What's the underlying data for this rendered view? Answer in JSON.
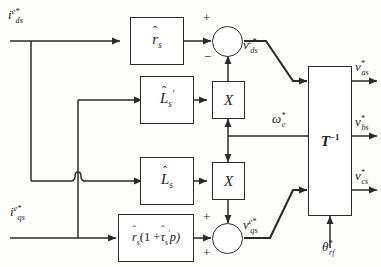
{
  "figure": {
    "type": "control-block-diagram",
    "style": "scanned grayscale line drawing"
  },
  "inputs": [
    {
      "id": "ids",
      "label_base": "i",
      "label_sup": "e*",
      "label_sub": "ds",
      "text": "i^(e*)_ds"
    },
    {
      "id": "iqs",
      "label_base": "i",
      "label_sup": "e*",
      "label_sub": "qs",
      "text": "i^(e*)_qs"
    },
    {
      "id": "we",
      "label_base": "ω",
      "label_sup": "*",
      "label_sub": "e",
      "text": "ω*_e"
    },
    {
      "id": "thrf",
      "label_base": "θ",
      "label_sup": "*",
      "label_sub": "rf",
      "text": "θ*_rf"
    }
  ],
  "blocks": [
    {
      "id": "rs",
      "label": "r̂_s",
      "kind": "gain"
    },
    {
      "id": "lsp",
      "label": "L̂'_s",
      "kind": "gain"
    },
    {
      "id": "ls",
      "label": "L̂_s",
      "kind": "gain"
    },
    {
      "id": "rstau",
      "label": "r̂_s (1 + τ̂'_s p)",
      "kind": "gain"
    },
    {
      "id": "mult1",
      "label": "X",
      "kind": "multiplier"
    },
    {
      "id": "mult2",
      "label": "X",
      "kind": "multiplier"
    },
    {
      "id": "tinv",
      "label": "T^(-1)",
      "kind": "transform"
    }
  ],
  "summers": [
    {
      "id": "sum_d",
      "signs": {
        "left": "+",
        "bottom": "−"
      },
      "output": "v^(e*)_ds"
    },
    {
      "id": "sum_q",
      "signs": {
        "left": "+",
        "top": "+"
      },
      "output": "v^(e*)_qs"
    }
  ],
  "outputs": [
    {
      "id": "vas",
      "label_base": "v",
      "label_sup": "*",
      "label_sub": "as",
      "text": "v*_as"
    },
    {
      "id": "vbs",
      "label_base": "v",
      "label_sup": "*",
      "label_sub": "bs",
      "text": "v*_bs"
    },
    {
      "id": "vcs",
      "label_base": "v",
      "label_sup": "*",
      "label_sub": "cs",
      "text": "v*_cs"
    }
  ],
  "intermediate": [
    {
      "id": "vds",
      "label_base": "v",
      "label_sup": "e*",
      "label_sub": "ds",
      "text": "v^(e*)_ds"
    },
    {
      "id": "vqs",
      "label_base": "v",
      "label_sup": "e*",
      "label_sub": "qs",
      "text": "v^(e*)_qs"
    }
  ],
  "glyphs": {
    "i": "i",
    "v": "v",
    "omega": "ω",
    "theta": "θ",
    "tau": "τ",
    "r": "r",
    "L": "L",
    "T": "T",
    "X": "X",
    "hat": "ˆ",
    "prime": "′",
    "plus": "+",
    "minus": "−",
    "exp_inv": "−1",
    "p": "p",
    "s": "s",
    "one": "1",
    "open_paren": "(",
    "close_paren": ")"
  },
  "labels": {
    "ids_base": "i",
    "ids_sup": "e*",
    "ids_sub": "ds",
    "iqs_base": "i",
    "iqs_sup": "e*",
    "iqs_sub": "qs",
    "we_base": "ω",
    "we_sup": "*",
    "we_sub": "e",
    "thrf_base": "θ",
    "thrf_sup": "*",
    "thrf_sub": "rf",
    "vds_base": "v",
    "vds_sup": "e*",
    "vds_sub": "ds",
    "vqs_base": "v",
    "vqs_sup": "e*",
    "vqs_sub": "qs",
    "vas_base": "v",
    "vas_sup": "*",
    "vas_sub": "as",
    "vbs_base": "v",
    "vbs_sup": "*",
    "vbs_sub": "bs",
    "vcs_base": "v",
    "vcs_sup": "*",
    "vcs_sub": "cs",
    "rs_base": "r",
    "rs_sub": "s",
    "lsp_base": "L",
    "lsp_sub": "s",
    "lsp_prime": "′",
    "ls_base": "L",
    "ls_sub": "s",
    "rstau_r": "r",
    "rstau_rsub": "s",
    "rstau_mid": "(1 +",
    "rstau_tau": "τ",
    "rstau_tsub": "s",
    "rstau_prime": "′",
    "rstau_end": "p)",
    "mult_x": "X",
    "t_base": "T",
    "t_exp": "−1",
    "sign_plus": "+",
    "sign_minus": "−"
  },
  "colors": {
    "ink": "#1a1a1a",
    "line": "#2a2a2a",
    "paper": "#fdfdfb",
    "box_fill": "#ffffff"
  }
}
